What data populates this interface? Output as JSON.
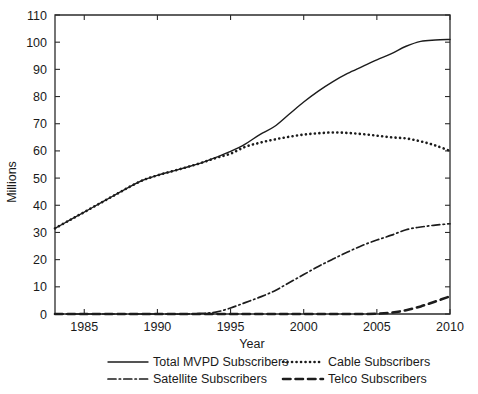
{
  "chart_data": {
    "type": "line",
    "title": "",
    "xlabel": "Year",
    "ylabel": "Millions",
    "xlim": [
      1983,
      2010
    ],
    "ylim": [
      0,
      110
    ],
    "xticks": [
      1985,
      1990,
      1995,
      2000,
      2005,
      2010
    ],
    "xticklabels": [
      "1985",
      "1990",
      "1995",
      "2000",
      "2005",
      "2010"
    ],
    "yticks": [
      0,
      10,
      20,
      30,
      40,
      50,
      60,
      70,
      80,
      90,
      100,
      110
    ],
    "yticklabels": [
      "0",
      "10",
      "20",
      "30",
      "40",
      "50",
      "60",
      "70",
      "80",
      "90",
      "100",
      "110"
    ],
    "grid": false,
    "legend_position": "below-axes",
    "x": [
      1983,
      1984,
      1985,
      1986,
      1987,
      1988,
      1989,
      1990,
      1991,
      1992,
      1993,
      1994,
      1995,
      1996,
      1997,
      1998,
      1999,
      2000,
      2001,
      2002,
      2003,
      2004,
      2005,
      2006,
      2007,
      2008,
      2009,
      2010
    ],
    "series": [
      {
        "name": "Total MVPD Subscribers",
        "style": "solid",
        "values": [
          31.5,
          34.5,
          37.5,
          40.5,
          43.5,
          46.5,
          49.2,
          51.0,
          52.5,
          54.0,
          55.6,
          57.6,
          59.8,
          62.5,
          66.0,
          69.0,
          73.5,
          78.0,
          82.0,
          85.5,
          88.5,
          91.0,
          93.5,
          95.8,
          98.5,
          100.3,
          100.8,
          101.0
        ]
      },
      {
        "name": "Cable Subscribers",
        "style": "dotted",
        "values": [
          31.5,
          34.5,
          37.5,
          40.5,
          43.5,
          46.5,
          49.2,
          51.0,
          52.5,
          54.0,
          55.6,
          57.4,
          59.0,
          61.5,
          63.0,
          64.2,
          65.2,
          66.0,
          66.5,
          66.8,
          66.6,
          66.2,
          65.6,
          65.0,
          64.6,
          63.5,
          62.0,
          60.0
        ]
      },
      {
        "name": "Satellite Subscribers",
        "style": "dash-dot",
        "values": [
          0,
          0,
          0,
          0,
          0,
          0,
          0,
          0,
          0,
          0,
          0.2,
          0.7,
          2.2,
          4.2,
          6.2,
          8.5,
          11.5,
          14.5,
          17.5,
          20.2,
          22.8,
          25.2,
          27.2,
          29.0,
          31.0,
          32.0,
          32.7,
          33.2
        ]
      },
      {
        "name": "Telco Subscribers",
        "style": "dashed",
        "values": [
          0,
          0,
          0,
          0,
          0,
          0,
          0,
          0,
          0,
          0,
          0,
          0,
          0,
          0,
          0,
          0,
          0,
          0,
          0,
          0,
          0,
          0,
          0.1,
          0.5,
          1.4,
          2.8,
          4.6,
          6.5
        ]
      }
    ],
    "legend": [
      {
        "label": "Total MVPD Subscribers",
        "style": "solid"
      },
      {
        "label": "Cable Subscribers",
        "style": "dotted"
      },
      {
        "label": "Satellite Subscribers",
        "style": "dash-dot"
      },
      {
        "label": "Telco Subscribers",
        "style": "dashed"
      }
    ]
  }
}
